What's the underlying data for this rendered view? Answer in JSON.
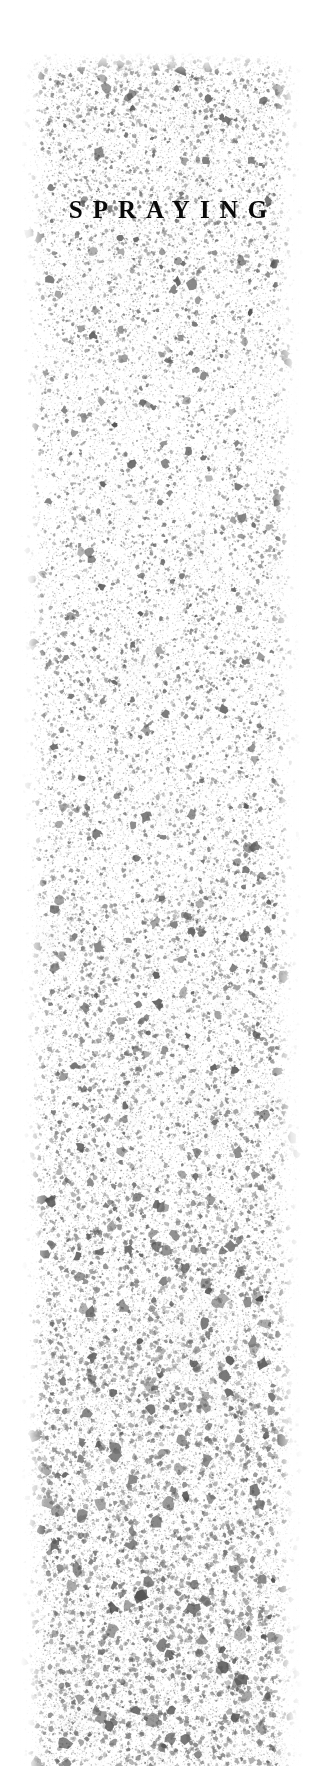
{
  "page": {
    "width": 336,
    "height": 1766,
    "background_color": "#ffffff"
  },
  "heading": {
    "text": "SPRAYING",
    "color": "#0a0a0a",
    "style": "serif small-caps heading, wide letter spacing",
    "center_x": 168,
    "baseline_y": 222
  },
  "spray_band": {
    "name": "ink-spatter-texture",
    "left": 20,
    "top": 52,
    "width": 284,
    "height": 1714,
    "speckle_color_dark": "#5a5a5a",
    "speckle_color_mid": "#8c8c8c",
    "speckle_color_light": "#bdbdbd",
    "background_color": "#ffffff",
    "density_profile": "dense and dark at top, lighter through the upper middle, increasingly dense and blotchy toward the bottom",
    "bands": [
      {
        "label": "top",
        "y_start": 52,
        "y_end": 430,
        "density": 0.85,
        "max_radius": 4.2,
        "darkness": 0.95
      },
      {
        "label": "upper-middle",
        "y_start": 430,
        "y_end": 800,
        "density": 0.62,
        "max_radius": 3.4,
        "darkness": 0.62
      },
      {
        "label": "middle",
        "y_start": 800,
        "y_end": 1150,
        "density": 0.7,
        "max_radius": 4.0,
        "darkness": 0.68
      },
      {
        "label": "lower-middle",
        "y_start": 1150,
        "y_end": 1450,
        "density": 0.88,
        "max_radius": 4.8,
        "darkness": 0.8
      },
      {
        "label": "bottom",
        "y_start": 1450,
        "y_end": 1766,
        "density": 1.0,
        "max_radius": 5.6,
        "darkness": 0.88
      }
    ]
  }
}
